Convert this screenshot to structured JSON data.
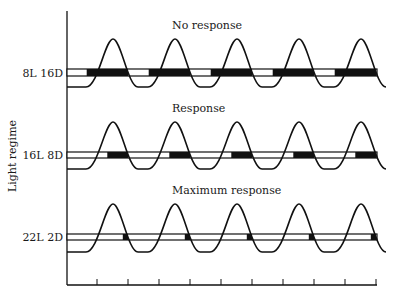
{
  "diagram": {
    "y_axis_label": "Light regime",
    "period_hours": 24,
    "tick_interval_hours": 12,
    "colors": {
      "line": "#111111",
      "dark": "#111111",
      "light": "#ffffff",
      "text": "#1a1a1a"
    },
    "rows": [
      {
        "regime": "8L 16D",
        "title": "No response",
        "light_hours": 8,
        "dark_hours": 16
      },
      {
        "regime": "16L 8D",
        "title": "Response",
        "light_hours": 16,
        "dark_hours": 8
      },
      {
        "regime": "22L 2D",
        "title": "Maximum response",
        "light_hours": 22,
        "dark_hours": 2
      }
    ]
  }
}
